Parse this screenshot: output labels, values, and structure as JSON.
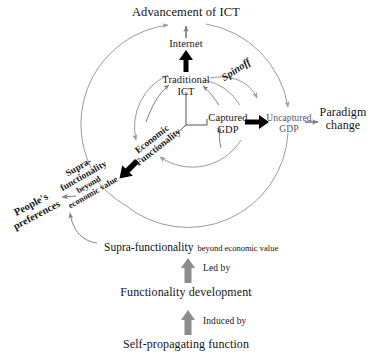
{
  "diagram": {
    "title": "Advancement of ICT",
    "type": "circular-flow-diagram",
    "background": "#ffffff",
    "colors": {
      "arc": "#9a9a9a",
      "thin_arrow": "#7d7d7d",
      "thick_arrow": "#000000",
      "gray_block_arrow": "#8c8c8c",
      "text": "#151515"
    },
    "nodes": [
      {
        "id": "advancement",
        "label": "Advancement of ICT",
        "x": 186,
        "y": 12,
        "style": "title"
      },
      {
        "id": "internet",
        "label": "Internet",
        "x": 186,
        "y": 45,
        "style": "node"
      },
      {
        "id": "traditional-ict",
        "label": "Traditional\nICT",
        "line1": "Traditional",
        "line2": "ICT",
        "x": 186,
        "y": 79,
        "style": "node"
      },
      {
        "id": "spinoff",
        "label": "Spinoff",
        "x": 243,
        "y": 72,
        "style": "rotated",
        "rotation": -33
      },
      {
        "id": "captured-gdp",
        "label": "Captured\nGDP",
        "line1": "Captured",
        "line2": "GDP",
        "x": 228,
        "y": 116,
        "style": "node"
      },
      {
        "id": "uncaptured-gdp",
        "label": "Uncaptured\nGDP",
        "line1": "Uncaptured",
        "line2": "GDP",
        "x": 289,
        "y": 118,
        "style": "node-small-gray"
      },
      {
        "id": "paradigm-change",
        "label": "Paradigm\nchange",
        "line1": "Paradigm",
        "line2": "change",
        "x": 343,
        "y": 112,
        "style": "big"
      },
      {
        "id": "economic-functionality",
        "label": "Economic\nFunctionality",
        "line1": "Economic",
        "line2": "Functionality",
        "x": 155,
        "y": 140,
        "style": "rotated",
        "rotation": -38
      },
      {
        "id": "supra-functionality-circle",
        "line1": "Supra-",
        "line2": "functionality",
        "line3": "beyond",
        "line4": "economic value",
        "x": 88,
        "y": 173,
        "style": "rotated",
        "rotation": -30
      },
      {
        "id": "peoples-preferences",
        "line1": "People's",
        "line2": "preferences",
        "x": 34,
        "y": 209,
        "style": "rotated",
        "rotation": -28
      },
      {
        "id": "supra-functionality-bottom",
        "big": "Supra-functionality",
        "small": "beyond economic value",
        "x": 104,
        "y": 242,
        "style": "mixed"
      },
      {
        "id": "functionality-development",
        "label": "Functionality development",
        "x": 186,
        "y": 292,
        "style": "big"
      },
      {
        "id": "self-propagating-function",
        "label": "Self-propagating function",
        "x": 186,
        "y": 344,
        "style": "big"
      }
    ],
    "edge_labels": [
      {
        "id": "led-by",
        "label": "Led by",
        "x": 203,
        "y": 267
      },
      {
        "id": "induced-by",
        "label": "Induced by",
        "x": 203,
        "y": 320
      }
    ],
    "arrows": {
      "advancement_up": {
        "style": "thin",
        "from": "internet",
        "to": "advancement"
      },
      "internet_up_thick": {
        "style": "thick",
        "from": "traditional-ict",
        "to": "internet"
      },
      "captured_to_uncaptured": {
        "style": "thick",
        "from": "captured-gdp",
        "to": "uncaptured-gdp"
      },
      "uncaptured_to_paradigm": {
        "style": "thin",
        "from": "uncaptured-gdp",
        "to": "paradigm-change"
      },
      "to_supra_thick": {
        "style": "thick",
        "from": "economic-functionality",
        "to": "supra-functionality-circle"
      },
      "supra_to_people": {
        "style": "thin",
        "from": "supra-functionality-circle",
        "to": "peoples-preferences"
      },
      "led_by": {
        "style": "block-gray",
        "from": "functionality-development",
        "to": "supra-functionality-bottom"
      },
      "induced_by": {
        "style": "block-gray",
        "from": "self-propagating-function",
        "to": "functionality-development"
      }
    },
    "circles": [
      {
        "id": "inner-circle",
        "cx": 188,
        "cy": 125,
        "r": 57,
        "stroke": "#9a9a9a"
      },
      {
        "id": "outer-circle",
        "cx": 188,
        "cy": 122,
        "r": 100,
        "stroke": "#9a9a9a"
      }
    ]
  }
}
